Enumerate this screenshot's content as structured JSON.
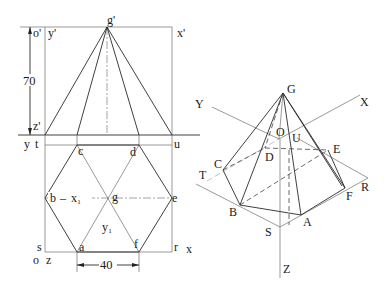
{
  "figure": {
    "type": "technical-drawing"
  },
  "left_view": {
    "front_view_labels": {
      "apex": "g'",
      "origin": "o'",
      "y_axis": "y'",
      "x_axis": "x'",
      "z_axis": "z'"
    },
    "ground_line_labels": {
      "left_y": "y",
      "left_t": "t",
      "right_u": "u"
    },
    "top_view_labels": {
      "c": "c",
      "d": "d",
      "b": "b",
      "x1": "x₁",
      "g": "g",
      "e": "e",
      "y1": "y₁",
      "a": "a",
      "f": "f",
      "s": "s",
      "r": "r",
      "x": "x",
      "o": "o",
      "z": "z"
    },
    "dimensions": {
      "height": "70",
      "edge": "40"
    }
  },
  "right_view": {
    "labels": {
      "apex": "G",
      "X": "X",
      "Y": "Y",
      "Z": "Z",
      "O": "O",
      "U": "U",
      "D": "D",
      "E": "E",
      "C": "C",
      "T": "T",
      "R": "R",
      "F": "F",
      "B": "B",
      "A": "A",
      "S": "S"
    }
  }
}
